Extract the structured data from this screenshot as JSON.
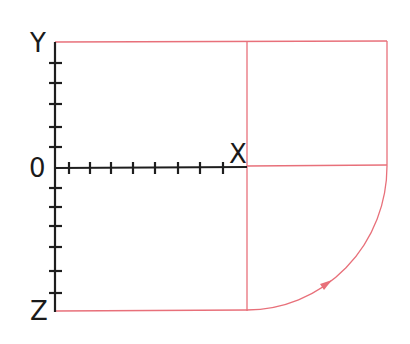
{
  "diagram": {
    "axes": {
      "y_label": "Y",
      "x_label": "X",
      "z_label": "Z",
      "origin_label": "0",
      "axis_color": "#1e1e1e"
    },
    "construction": {
      "line_color": "#e8707a",
      "description": "Oblique projection frame with quarter-circle arc and direction arrow"
    }
  }
}
